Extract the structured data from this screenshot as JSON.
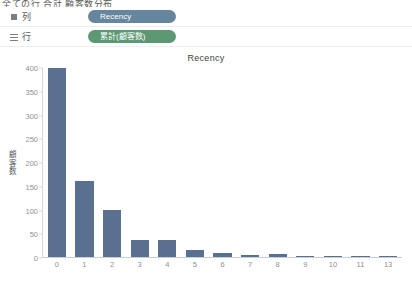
{
  "top_strip": {
    "text": "全ての行  合計 顧客数分布"
  },
  "shelves": [
    {
      "icon": "columns-icon",
      "label": "列",
      "pill": {
        "text": "Recency",
        "type": "dimension",
        "color": "#5a7b96"
      }
    },
    {
      "icon": "rows-icon",
      "label": "行",
      "pill": {
        "text": "累計(顧客数)",
        "type": "measure",
        "color": "#4f9168"
      }
    }
  ],
  "chart_data": {
    "type": "bar",
    "title": "Recency",
    "xlabel": "",
    "ylabel": "顧客数",
    "categories": [
      "0",
      "1",
      "2",
      "3",
      "4",
      "5",
      "6",
      "7",
      "8",
      "9",
      "10",
      "11",
      "13"
    ],
    "values": [
      400,
      160,
      100,
      36,
      37,
      15,
      8,
      4,
      6,
      2,
      1,
      1,
      1
    ],
    "ylim": [
      0,
      400
    ],
    "yticks": [
      0,
      50,
      100,
      150,
      200,
      250,
      300,
      350,
      400
    ],
    "grid": false,
    "legend": "none",
    "bar_color": "#5a7090"
  }
}
